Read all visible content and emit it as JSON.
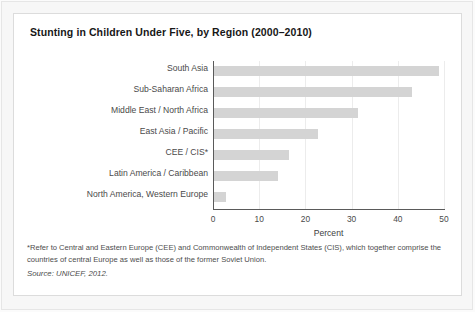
{
  "figure": {
    "title": "Stunting in Children Under Five, by Region (2000–2010)",
    "footnote": "*Refer to Central and Eastern Europe (CEE) and Commonwealth of Independent States (CIS), which together comprise the countries of central Europe as well as those of the former Soviet Union.",
    "source": "Source: UNICEF, 2012."
  },
  "chart_data": {
    "type": "bar",
    "orientation": "horizontal",
    "title": "Stunting in Children Under Five, by Region (2000–2010)",
    "xlabel": "Percent",
    "ylabel": "",
    "xlim": [
      0,
      50
    ],
    "xticks": [
      0,
      10,
      20,
      30,
      40,
      50
    ],
    "xtick_labels": [
      "0",
      "10",
      "20",
      "30",
      "40",
      "50"
    ],
    "grid": "vertical",
    "legend": "none",
    "bar_color": "#d4d4d4",
    "categories": [
      "South Asia",
      "Sub-Saharan Africa",
      "Middle East / North Africa",
      "East Asia / Pacific",
      "CEE / CIS*",
      "Latin America / Caribbean",
      "North America, Western Europe"
    ],
    "values": [
      48.7,
      42.8,
      31.2,
      22.6,
      16.3,
      13.9,
      2.6
    ]
  }
}
